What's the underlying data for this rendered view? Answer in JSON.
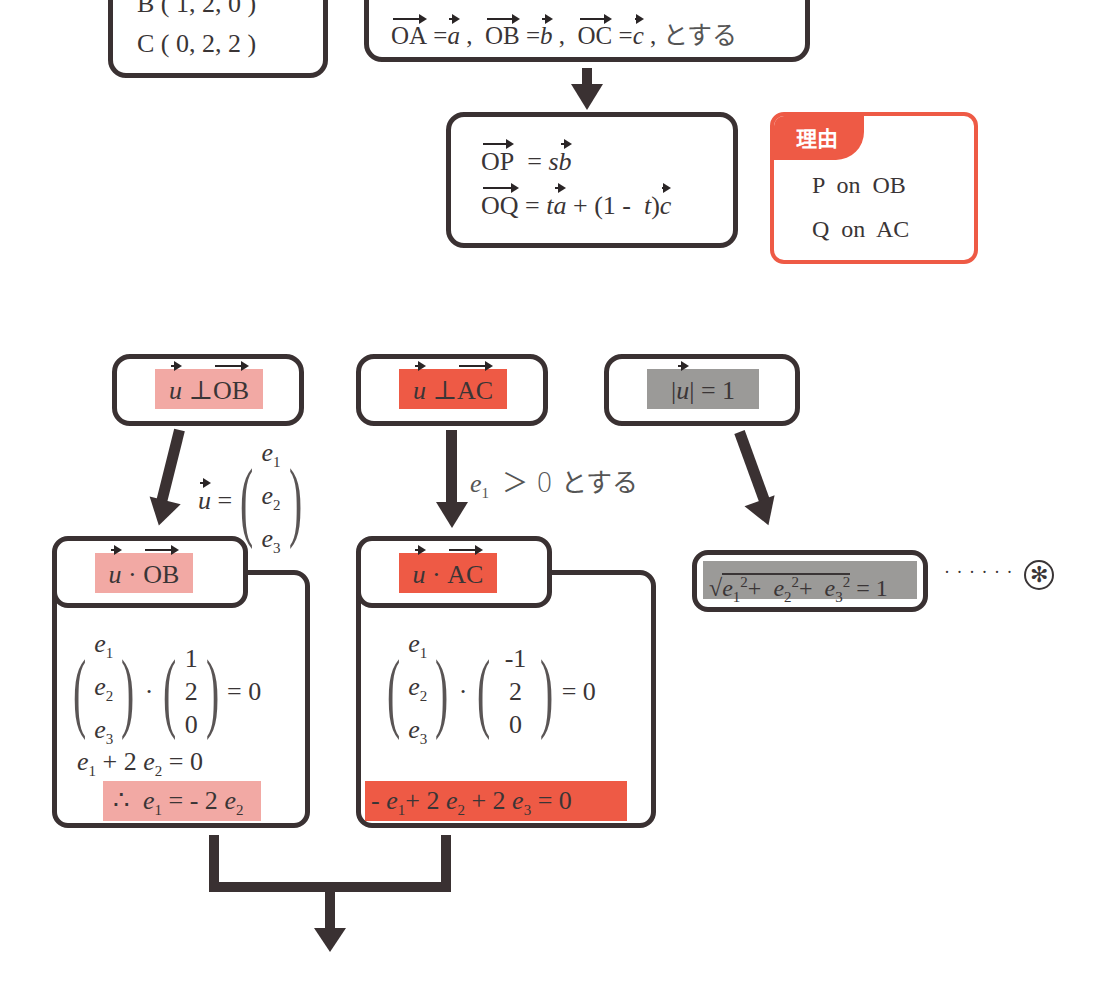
{
  "points_box": {
    "line_b": "B ( 1,  2,  0 )",
    "line_c": "C ( 0,  2,  2 )"
  },
  "definition_box": {
    "oa": "OA",
    "a": "a",
    "ob": "OB",
    "b": "b",
    "oc": "OC",
    "c": "c",
    "suffix": "とする"
  },
  "position_box": {
    "op": "OP",
    "op_rhs_coef": "s",
    "op_rhs_vec": "b",
    "oq": "OQ",
    "oq_t": "t",
    "oq_a": "a",
    "oq_mid": "+ (1 -",
    "oq_t2": "t",
    "oq_c": "c"
  },
  "reason_box": {
    "tag": "理由",
    "line1": "P  on  OB",
    "line2": "Q  on  AC",
    "accent_color": "#ee5a45"
  },
  "conditions": {
    "perp_ob": {
      "u": "u",
      "sym": "⊥",
      "vec": "OB"
    },
    "perp_ac": {
      "u": "u",
      "sym": "⊥",
      "vec": "AC"
    },
    "unit": {
      "u": "u",
      "rhs": "= 1"
    }
  },
  "annotations": {
    "u_def_lhs": "u",
    "u_def_eq": "=",
    "u_components": [
      "e",
      "e",
      "e"
    ],
    "u_subs": [
      "1",
      "2",
      "3"
    ],
    "e1_positive": "e",
    "e1_sub": "1",
    "e1_rest": "＞  0  とする"
  },
  "dot_ob_panel": {
    "title_u": "u",
    "title_dot": "·",
    "title_vec": "OB",
    "left_vector": [
      "e",
      "e",
      "e"
    ],
    "left_subs": [
      "1",
      "2",
      "3"
    ],
    "right_vector": [
      "1",
      "2",
      "0"
    ],
    "eq": "= 0",
    "eq1_parts": {
      "e1": "e",
      "s1": "1",
      "mid": "+ 2",
      "e2": "e",
      "s2": "2",
      "end": "= 0"
    },
    "result_parts": {
      "therefore": "∴",
      "e1": "e",
      "s1": "1",
      "mid": "= - 2",
      "e2": "e",
      "s2": "2"
    },
    "highlight_color": "#f2a9a4"
  },
  "dot_ac_panel": {
    "title_u": "u",
    "title_dot": "·",
    "title_vec": "AC",
    "left_vector": [
      "e",
      "e",
      "e"
    ],
    "left_subs": [
      "1",
      "2",
      "3"
    ],
    "right_vector": [
      "-1",
      "2",
      "0"
    ],
    "eq": "= 0",
    "result_parts": {
      "lead": "-",
      "e1": "e",
      "s1": "1",
      "p1": "+ 2",
      "e2": "e",
      "s2": "2",
      "p2": "+ 2",
      "e3": "e",
      "s3": "3",
      "end": "= 0"
    },
    "highlight_color": "#ee5a45"
  },
  "norm_box": {
    "e": "e",
    "subs": [
      "1",
      "2",
      "3"
    ],
    "sq": "2",
    "plus": "+",
    "end": "= 1",
    "dots": "· · · · · ·",
    "marker": "✻",
    "highlight_color": "#9b9a98"
  }
}
